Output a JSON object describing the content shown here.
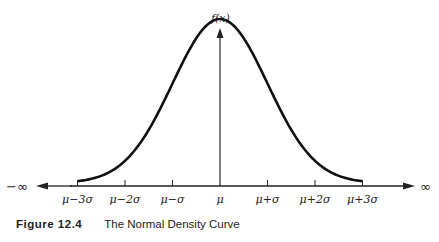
{
  "chart_data": {
    "type": "line",
    "title": "",
    "ylabel": "f(x)",
    "xlabel": "",
    "x_left_label": "−∞",
    "x_right_label": "∞",
    "tick_labels": [
      "μ−3σ",
      "μ−2σ",
      "μ−σ",
      "μ",
      "μ+σ",
      "μ+2σ",
      "μ+3σ"
    ],
    "tick_values": [
      -3,
      -2,
      -1,
      0,
      1,
      2,
      3
    ],
    "curve": {
      "name": "Normal density",
      "mean": 0,
      "sd": 1,
      "x_range": [
        -3,
        3
      ]
    },
    "grid": false,
    "legend": "none"
  },
  "caption": {
    "number": "Figure 12.4",
    "text": "The Normal Density Curve"
  }
}
